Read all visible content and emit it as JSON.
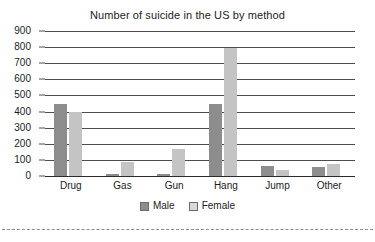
{
  "chart_data": {
    "type": "bar",
    "title": "Number of suicide in the US by method",
    "xlabel": "",
    "ylabel": "",
    "categories": [
      "Drug",
      "Gas",
      "Gun",
      "Hang",
      "Jump",
      "Other"
    ],
    "series": [
      {
        "name": "Male",
        "color": "#8d8d8d",
        "values": [
          445,
          10,
          10,
          450,
          65,
          55
        ]
      },
      {
        "name": "Female",
        "color": "#c4c4c4",
        "values": [
          400,
          85,
          170,
          795,
          35,
          75
        ]
      }
    ],
    "ylim": [
      0,
      900
    ],
    "ytick_labels": [
      "900",
      "800",
      "700",
      "600",
      "500",
      "400",
      "300",
      "200",
      "100",
      "0"
    ],
    "ytick_values": [
      900,
      800,
      700,
      600,
      500,
      400,
      300,
      200,
      100,
      0
    ],
    "grid": true,
    "legend_position": "bottom"
  },
  "legend": {
    "items": [
      {
        "label": "Male"
      },
      {
        "label": "Female"
      }
    ]
  }
}
